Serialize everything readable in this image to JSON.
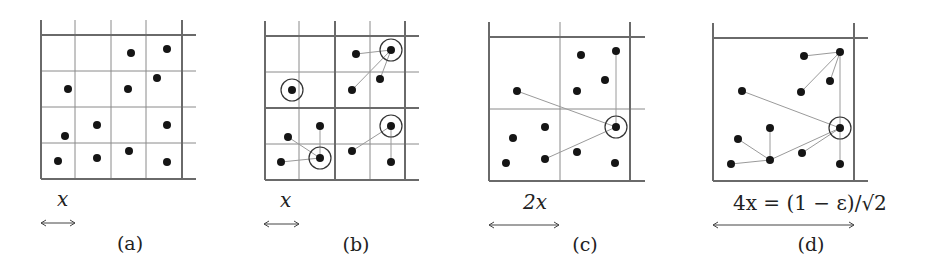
{
  "figure": {
    "panels": [
      {
        "id": "a",
        "caption": "(a)",
        "caption_pos": [
          130,
          250
        ],
        "scale_label": "x",
        "scale_label_italic": true,
        "scale_label_pos": [
          57,
          206
        ],
        "arrow": {
          "x1": 41,
          "x2": 75,
          "y": 223
        },
        "grid": {
          "thin_v": [
            75,
            111,
            146
          ],
          "thin_h": [
            71,
            107,
            143
          ],
          "thick_v": [
            41,
            182
          ],
          "thick_h": [
            35,
            179
          ],
          "extent": {
            "x0": 41,
            "x1": 196,
            "y0": 20,
            "y1": 179
          }
        },
        "points": [
          [
            131,
            53
          ],
          [
            167,
            49
          ],
          [
            68,
            89
          ],
          [
            128,
            89
          ],
          [
            157,
            78
          ],
          [
            97,
            125
          ],
          [
            65,
            136
          ],
          [
            167,
            125
          ],
          [
            58,
            161
          ],
          [
            97,
            158
          ],
          [
            129,
            151
          ],
          [
            167,
            162
          ]
        ],
        "circled": [],
        "edges": []
      },
      {
        "id": "b",
        "caption": "(b)",
        "caption_pos": [
          356,
          251
        ],
        "scale_label": "x",
        "scale_label_italic": true,
        "scale_label_pos": [
          280,
          207
        ],
        "arrow": {
          "x1": 264,
          "x2": 299,
          "y": 224
        },
        "grid": {
          "thin_v": [
            299,
            370
          ],
          "thin_h": [
            72,
            144
          ],
          "thick_v": [
            265,
            335,
            405
          ],
          "thick_h": [
            36,
            108,
            180
          ],
          "extent": {
            "x0": 265,
            "x1": 419,
            "y0": 21,
            "y1": 180
          }
        },
        "points": [
          [
            356,
            54
          ],
          [
            391,
            50
          ],
          [
            380,
            79
          ],
          [
            352,
            90
          ],
          [
            292,
            90
          ],
          [
            320,
            126
          ],
          [
            288,
            137
          ],
          [
            320,
            158
          ],
          [
            281,
            162
          ],
          [
            391,
            126
          ],
          [
            352,
            151
          ],
          [
            391,
            162
          ]
        ],
        "circled": [
          [
            391,
            50
          ],
          [
            292,
            90
          ],
          [
            320,
            158
          ],
          [
            391,
            126
          ]
        ],
        "edges": [
          [
            [
              356,
              54
            ],
            [
              391,
              50
            ]
          ],
          [
            [
              380,
              79
            ],
            [
              391,
              50
            ]
          ],
          [
            [
              352,
              90
            ],
            [
              391,
              50
            ]
          ],
          [
            [
              320,
              126
            ],
            [
              320,
              158
            ]
          ],
          [
            [
              288,
              137
            ],
            [
              320,
              158
            ]
          ],
          [
            [
              281,
              162
            ],
            [
              320,
              158
            ]
          ],
          [
            [
              352,
              151
            ],
            [
              391,
              126
            ]
          ],
          [
            [
              391,
              162
            ],
            [
              391,
              126
            ]
          ]
        ]
      },
      {
        "id": "c",
        "caption": "(c)",
        "caption_pos": [
          585,
          251
        ],
        "scale_label": "2x",
        "scale_label_italic": true,
        "scale_label_pos": [
          523,
          209
        ],
        "arrow": {
          "x1": 489,
          "x2": 559,
          "y": 225
        },
        "grid": {
          "thin_v": [
            560
          ],
          "thin_h": [
            109
          ],
          "thick_v": [
            489,
            630
          ],
          "thick_h": [
            37,
            181
          ],
          "extent": {
            "x0": 489,
            "x1": 645,
            "y0": 22,
            "y1": 181
          }
        },
        "points": [
          [
            581,
            55
          ],
          [
            616,
            51
          ],
          [
            605,
            80
          ],
          [
            577,
            91
          ],
          [
            517,
            91
          ],
          [
            616,
            127
          ],
          [
            545,
            127
          ],
          [
            513,
            138
          ],
          [
            506,
            163
          ],
          [
            545,
            159
          ],
          [
            577,
            152
          ],
          [
            615,
            163
          ]
        ],
        "circled": [
          [
            616,
            127
          ]
        ],
        "edges": [
          [
            [
              616,
              51
            ],
            [
              616,
              127
            ]
          ],
          [
            [
              517,
              91
            ],
            [
              616,
              127
            ]
          ],
          [
            [
              545,
              159
            ],
            [
              616,
              127
            ]
          ]
        ]
      },
      {
        "id": "d",
        "caption": "(d)",
        "caption_pos": [
          811,
          251
        ],
        "scale_label": "4x = (1 − ε)/√2",
        "scale_label_italic": false,
        "scale_label_pos": [
          733,
          210
        ],
        "arrow": {
          "x1": 713,
          "x2": 854,
          "y": 225
        },
        "grid": {
          "thin_v": [],
          "thin_h": [],
          "thick_v": [
            713,
            854
          ],
          "thick_h": [
            38,
            181
          ],
          "extent": {
            "x0": 713,
            "x1": 868,
            "y0": 23,
            "y1": 181
          }
        },
        "points": [
          [
            804,
            56
          ],
          [
            840,
            52
          ],
          [
            830,
            81
          ],
          [
            801,
            92
          ],
          [
            742,
            91
          ],
          [
            840,
            128
          ],
          [
            770,
            128
          ],
          [
            738,
            139
          ],
          [
            731,
            164
          ],
          [
            770,
            160
          ],
          [
            802,
            153
          ],
          [
            840,
            164
          ]
        ],
        "circled": [
          [
            840,
            128
          ]
        ],
        "edges": [
          [
            [
              804,
              56
            ],
            [
              840,
              52
            ]
          ],
          [
            [
              830,
              81
            ],
            [
              840,
              52
            ]
          ],
          [
            [
              801,
              92
            ],
            [
              840,
              52
            ]
          ],
          [
            [
              840,
              52
            ],
            [
              840,
              128
            ]
          ],
          [
            [
              742,
              91
            ],
            [
              840,
              128
            ]
          ],
          [
            [
              840,
              164
            ],
            [
              840,
              128
            ]
          ],
          [
            [
              802,
              153
            ],
            [
              840,
              128
            ]
          ],
          [
            [
              770,
              160
            ],
            [
              840,
              128
            ]
          ],
          [
            [
              770,
              128
            ],
            [
              770,
              160
            ]
          ],
          [
            [
              738,
              139
            ],
            [
              770,
              160
            ]
          ],
          [
            [
              731,
              164
            ],
            [
              770,
              160
            ]
          ]
        ]
      }
    ],
    "colors": {
      "background": "#ffffff",
      "dot": "#151515",
      "grid_thin": "#8a8a8a",
      "grid_thick": "#6a6a6a",
      "edge": "#9a9a9a",
      "ring": "#333333"
    },
    "dot_radius": 4,
    "ring_radius": 11
  }
}
